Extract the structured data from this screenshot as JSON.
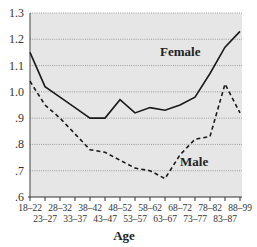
{
  "chart_data": {
    "type": "line",
    "title": "",
    "xlabel": "Age",
    "ylabel": "",
    "ylim": [
      0.6,
      1.3
    ],
    "yticks": [
      "1.3",
      "1.2",
      "1.1",
      "1.0",
      ".9",
      ".8",
      ".7",
      ".6"
    ],
    "ytick_values": [
      1.3,
      1.2,
      1.1,
      1.0,
      0.9,
      0.8,
      0.7,
      0.6
    ],
    "grid": true,
    "legend": "inline labels",
    "categories": [
      "18–22",
      "23–27",
      "28–32",
      "33–37",
      "38–42",
      "43–47",
      "48–52",
      "53–57",
      "58–62",
      "63–67",
      "68–72",
      "73–77",
      "78–82",
      "83–87",
      "88–99"
    ],
    "series": [
      {
        "name": "Female",
        "style": "solid",
        "values": [
          1.15,
          1.02,
          0.98,
          0.94,
          0.9,
          0.9,
          0.97,
          0.92,
          0.94,
          0.93,
          0.95,
          0.98,
          1.07,
          1.17,
          1.23
        ]
      },
      {
        "name": "Male",
        "style": "dashed",
        "values": [
          1.04,
          0.95,
          0.9,
          0.84,
          0.78,
          0.77,
          0.74,
          0.71,
          0.7,
          0.67,
          0.76,
          0.82,
          0.83,
          1.03,
          0.92
        ]
      }
    ],
    "annotations": [
      {
        "text": "Female",
        "series": "Female"
      },
      {
        "text": "Male",
        "series": "Male"
      }
    ]
  },
  "colors": {
    "plot_background": "#e6e6e6",
    "gridline": "#8a8a8a",
    "line": "#1a1a1a"
  }
}
